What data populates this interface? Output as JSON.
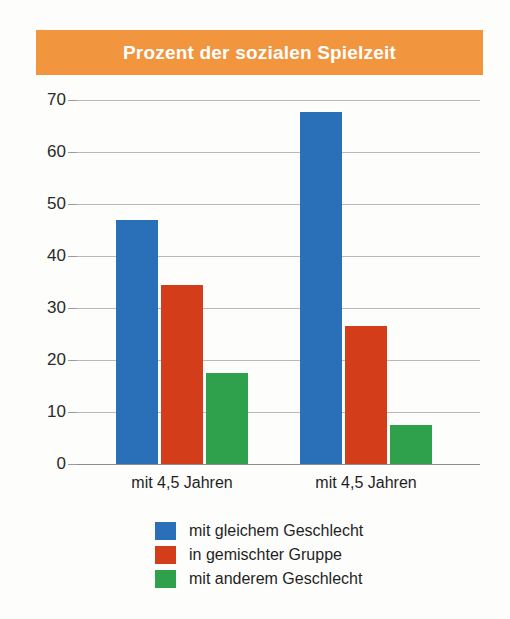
{
  "title": "Prozent der sozialen Spielzeit",
  "colors": {
    "banner": "#f2953f",
    "banner_text": "#ffffff",
    "blue": "#2a70b8",
    "red": "#d43d1a",
    "green": "#2fa14c",
    "grid": "#b9b9b9",
    "axis_text": "#2a2a2a"
  },
  "chart_data": {
    "type": "bar",
    "title": "Prozent der sozialen Spielzeit",
    "xlabel": "",
    "ylabel": "",
    "ylim": [
      0,
      70
    ],
    "yticks": [
      0,
      10,
      20,
      30,
      40,
      50,
      60,
      70
    ],
    "ytick_labels": [
      "0",
      "10",
      "20",
      "30",
      "40",
      "50",
      "60",
      "70"
    ],
    "grid": true,
    "grid_axis": "y",
    "legend_position": "bottom",
    "categories": [
      "mit 4,5 Jahren",
      "mit 4,5 Jahren"
    ],
    "series": [
      {
        "name": "mit gleichem Geschlecht",
        "color": "#2a70b8",
        "values": [
          47,
          67.7
        ]
      },
      {
        "name": "in gemischter Gruppe",
        "color": "#d43d1a",
        "values": [
          34.5,
          26.5
        ]
      },
      {
        "name": "mit anderem Geschlecht",
        "color": "#2fa14c",
        "values": [
          17.5,
          7.5
        ]
      }
    ]
  }
}
